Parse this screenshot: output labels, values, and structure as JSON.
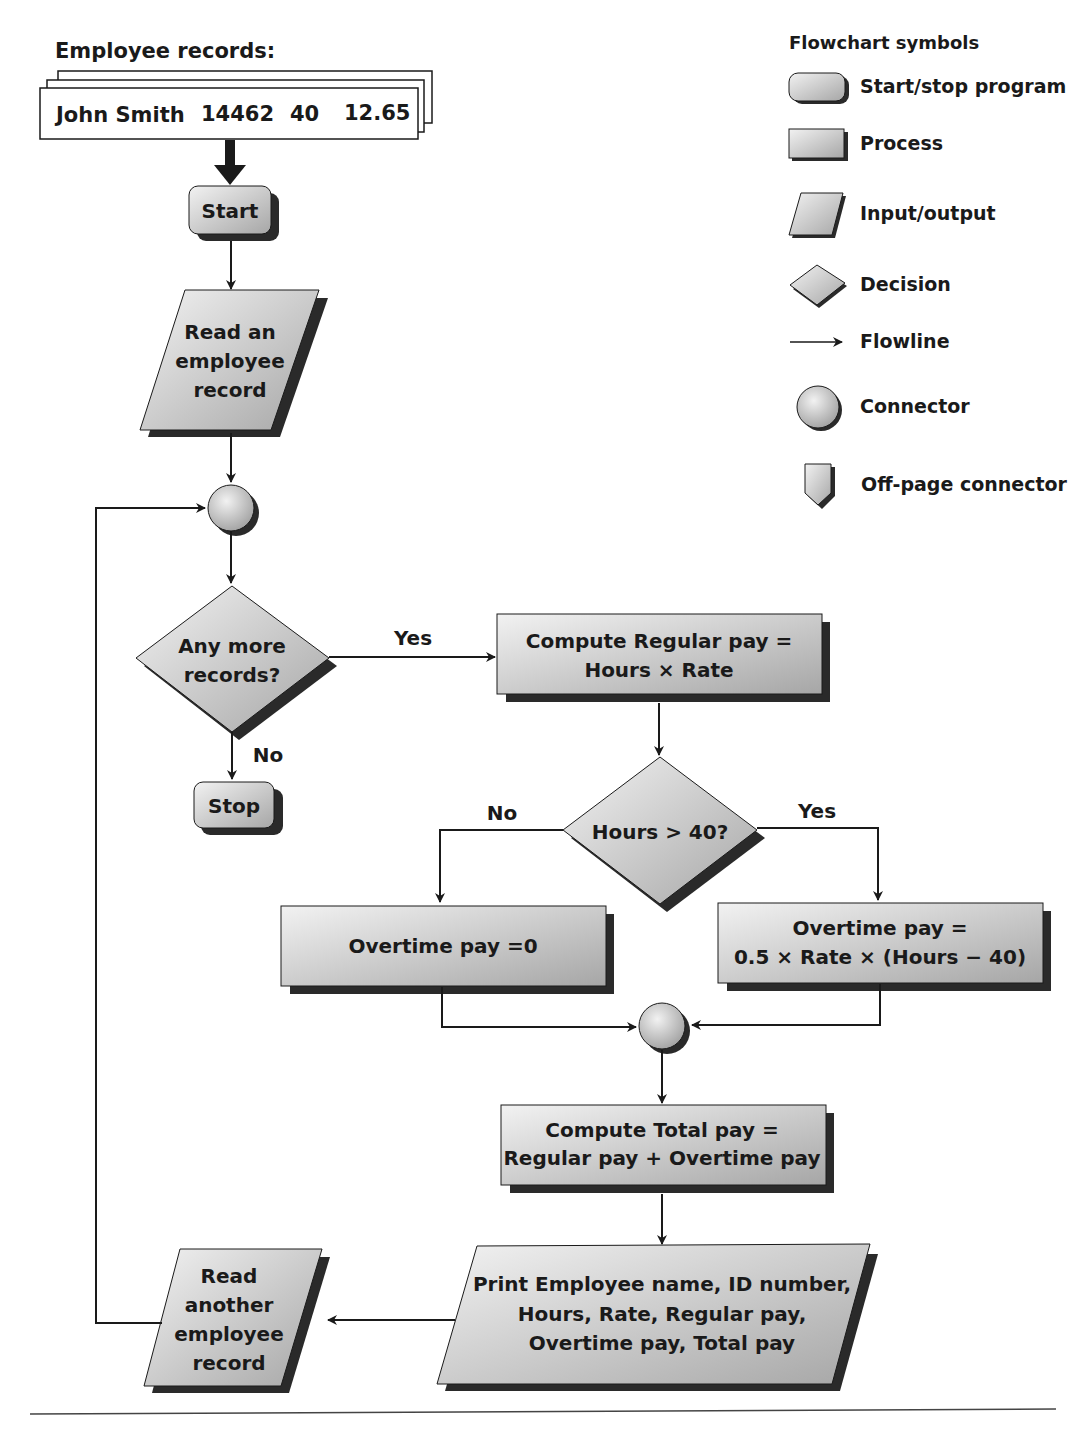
{
  "records": {
    "title": "Employee records:",
    "fields": [
      "John Smith",
      "14462",
      "40",
      "12.65"
    ]
  },
  "legend": {
    "title": "Flowchart symbols",
    "items": [
      {
        "symbol": "terminal",
        "label": "Start/stop program"
      },
      {
        "symbol": "process",
        "label": "Process"
      },
      {
        "symbol": "io",
        "label": "Input/output"
      },
      {
        "symbol": "decision",
        "label": "Decision"
      },
      {
        "symbol": "flowline",
        "label": "Flowline"
      },
      {
        "symbol": "connector",
        "label": "Connector"
      },
      {
        "symbol": "offpage",
        "label": "Off-page connector"
      }
    ]
  },
  "nodes": {
    "start": {
      "type": "terminal",
      "lines": [
        "Start"
      ]
    },
    "read_first": {
      "type": "io",
      "lines": [
        "Read an",
        "employee",
        "record"
      ]
    },
    "connector_top": {
      "type": "connector"
    },
    "any_more": {
      "type": "decision",
      "lines": [
        "Any more",
        "records?"
      ]
    },
    "stop": {
      "type": "terminal",
      "lines": [
        "Stop"
      ]
    },
    "regular_pay": {
      "type": "process",
      "lines": [
        "Compute Regular pay =",
        "Hours × Rate"
      ]
    },
    "hours_check": {
      "type": "decision",
      "lines": [
        "Hours > 40?"
      ]
    },
    "ot_zero": {
      "type": "process",
      "lines": [
        "Overtime pay =0"
      ]
    },
    "ot_calc": {
      "type": "process",
      "lines": [
        "Overtime pay =",
        "0.5 × Rate × (Hours − 40)"
      ]
    },
    "connector_mid": {
      "type": "connector"
    },
    "total_pay": {
      "type": "process",
      "lines": [
        "Compute Total pay =",
        "Regular pay + Overtime pay"
      ]
    },
    "print": {
      "type": "io",
      "lines": [
        "Print Employee name, ID number,",
        "Hours, Rate, Regular pay,",
        "Overtime pay, Total pay"
      ]
    },
    "read_another": {
      "type": "io",
      "lines": [
        "Read",
        "another",
        "employee",
        "record"
      ]
    }
  },
  "edge_labels": {
    "any_more_yes": "Yes",
    "any_more_no": "No",
    "hours_no": "No",
    "hours_yes": "Yes"
  },
  "colors": {
    "shape_fill_light": "#efefef",
    "shape_fill_dark": "#a9a9a9",
    "shadow": "#2a2a2a",
    "stroke": "#1a1a1a",
    "text": "#1a1a1a"
  }
}
